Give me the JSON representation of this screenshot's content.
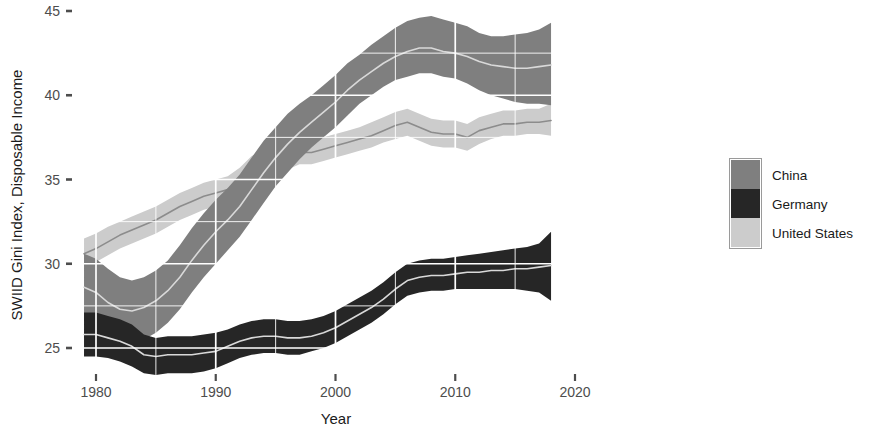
{
  "chart_data": {
    "type": "area",
    "title": "",
    "xlabel": "Year",
    "ylabel": "SWIID Gini Index, Disposable Income",
    "xlim": [
      1978.5,
      2021.5
    ],
    "ylim": [
      23.2,
      45.6
    ],
    "xticks": [
      1980,
      1990,
      2000,
      2010,
      2020
    ],
    "xtick_labels": [
      "1980",
      "1990",
      "2000",
      "2010",
      "2020"
    ],
    "yticks": [
      25,
      30,
      35,
      40,
      45
    ],
    "ytick_labels": [
      "25",
      "30",
      "35",
      "40",
      "45"
    ],
    "grid": true,
    "grid_color": "#ffffff",
    "legend_position": "right",
    "band_style": "ribbon with center line",
    "x": [
      1979,
      1980,
      1981,
      1982,
      1983,
      1984,
      1985,
      1986,
      1987,
      1988,
      1989,
      1990,
      1991,
      1992,
      1993,
      1994,
      1995,
      1996,
      1997,
      1998,
      1999,
      2000,
      2001,
      2002,
      2003,
      2004,
      2005,
      2006,
      2007,
      2008,
      2009,
      2010,
      2011,
      2012,
      2013,
      2014,
      2015,
      2016,
      2017,
      2018
    ],
    "series": [
      {
        "name": "China",
        "color": "#7f7f7f",
        "line_color": "#d9d9d9",
        "center": [
          28.6,
          28.3,
          27.7,
          27.3,
          27.2,
          27.4,
          27.8,
          28.4,
          29.2,
          30.2,
          31.1,
          31.9,
          32.6,
          33.4,
          34.4,
          35.4,
          36.3,
          37.1,
          37.8,
          38.4,
          39.0,
          39.6,
          40.3,
          40.9,
          41.4,
          41.9,
          42.3,
          42.6,
          42.8,
          42.8,
          42.6,
          42.5,
          42.3,
          42.0,
          41.8,
          41.7,
          41.6,
          41.6,
          41.7,
          41.8
        ],
        "lower": [
          26.6,
          26.3,
          25.8,
          25.5,
          25.4,
          25.5,
          25.9,
          26.5,
          27.3,
          28.3,
          29.2,
          30.0,
          30.8,
          31.6,
          32.6,
          33.6,
          34.6,
          35.4,
          36.2,
          36.9,
          37.5,
          38.1,
          38.8,
          39.5,
          40.0,
          40.5,
          40.9,
          41.1,
          41.3,
          41.3,
          41.1,
          41.0,
          40.7,
          40.3,
          40.0,
          39.8,
          39.6,
          39.5,
          39.5,
          39.4
        ],
        "upper": [
          30.6,
          30.3,
          29.7,
          29.2,
          29.0,
          29.2,
          29.6,
          30.2,
          31.1,
          32.1,
          33.0,
          33.8,
          34.5,
          35.3,
          36.3,
          37.3,
          38.1,
          38.9,
          39.5,
          40.0,
          40.6,
          41.2,
          41.9,
          42.4,
          43.0,
          43.5,
          44.0,
          44.4,
          44.6,
          44.7,
          44.5,
          44.3,
          44.1,
          43.7,
          43.5,
          43.5,
          43.6,
          43.7,
          43.9,
          44.3
        ]
      },
      {
        "name": "Germany",
        "color": "#262626",
        "line_color": "#d9d9d9",
        "center": [
          25.8,
          25.8,
          25.6,
          25.4,
          25.1,
          24.6,
          24.5,
          24.6,
          24.6,
          24.6,
          24.7,
          24.8,
          25.1,
          25.4,
          25.6,
          25.7,
          25.7,
          25.6,
          25.6,
          25.7,
          25.9,
          26.2,
          26.6,
          27.0,
          27.4,
          27.9,
          28.5,
          29.0,
          29.2,
          29.3,
          29.3,
          29.4,
          29.5,
          29.5,
          29.6,
          29.6,
          29.7,
          29.7,
          29.8,
          29.9
        ],
        "lower": [
          24.5,
          24.5,
          24.4,
          24.2,
          23.9,
          23.5,
          23.4,
          23.5,
          23.5,
          23.5,
          23.6,
          23.8,
          24.1,
          24.4,
          24.6,
          24.7,
          24.7,
          24.6,
          24.6,
          24.8,
          25.0,
          25.3,
          25.7,
          26.1,
          26.5,
          27.0,
          27.6,
          28.1,
          28.3,
          28.4,
          28.4,
          28.5,
          28.5,
          28.5,
          28.5,
          28.5,
          28.5,
          28.4,
          28.3,
          27.8
        ],
        "upper": [
          27.1,
          27.1,
          26.9,
          26.7,
          26.4,
          25.8,
          25.6,
          25.7,
          25.7,
          25.7,
          25.8,
          25.9,
          26.1,
          26.4,
          26.6,
          26.7,
          26.7,
          26.6,
          26.6,
          26.7,
          26.9,
          27.2,
          27.6,
          28.0,
          28.4,
          28.9,
          29.5,
          30.0,
          30.2,
          30.3,
          30.3,
          30.4,
          30.5,
          30.6,
          30.7,
          30.8,
          30.9,
          31.0,
          31.2,
          31.9
        ]
      },
      {
        "name": "United States",
        "color": "#cccccc",
        "line_color": "#8c8c8c",
        "center": [
          30.6,
          30.9,
          31.3,
          31.7,
          32.0,
          32.3,
          32.6,
          33.0,
          33.4,
          33.7,
          34.0,
          34.2,
          34.4,
          34.9,
          35.6,
          35.9,
          36.1,
          36.3,
          36.6,
          36.6,
          36.8,
          37.0,
          37.2,
          37.4,
          37.6,
          37.9,
          38.2,
          38.4,
          38.1,
          37.8,
          37.7,
          37.7,
          37.5,
          37.9,
          38.1,
          38.3,
          38.3,
          38.4,
          38.4,
          38.5
        ],
        "lower": [
          29.8,
          30.1,
          30.5,
          30.9,
          31.2,
          31.5,
          31.8,
          32.2,
          32.6,
          32.9,
          33.2,
          33.4,
          33.6,
          34.1,
          34.8,
          35.1,
          35.4,
          35.6,
          35.9,
          35.9,
          36.1,
          36.3,
          36.5,
          36.7,
          36.9,
          37.2,
          37.4,
          37.6,
          37.3,
          37.0,
          36.9,
          36.9,
          36.7,
          37.1,
          37.4,
          37.6,
          37.6,
          37.7,
          37.7,
          37.6
        ],
        "upper": [
          31.5,
          31.8,
          32.2,
          32.5,
          32.8,
          33.1,
          33.4,
          33.8,
          34.2,
          34.5,
          34.8,
          35.0,
          35.2,
          35.7,
          36.4,
          36.7,
          36.9,
          37.1,
          37.3,
          37.3,
          37.5,
          37.7,
          37.9,
          38.1,
          38.4,
          38.7,
          39.0,
          39.2,
          38.9,
          38.6,
          38.5,
          38.5,
          38.3,
          38.7,
          38.9,
          39.1,
          39.1,
          39.2,
          39.2,
          39.5
        ]
      }
    ],
    "legend": {
      "entries": [
        {
          "label": "China",
          "color": "#7f7f7f"
        },
        {
          "label": "Germany",
          "color": "#262626"
        },
        {
          "label": "United States",
          "color": "#cccccc"
        }
      ]
    }
  }
}
